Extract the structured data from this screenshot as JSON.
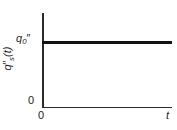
{
  "chart_data": {
    "type": "line",
    "title": "",
    "xlabel": "t",
    "ylabel": "q″ₛ(t)",
    "ylabel_base": "q",
    "ylabel_prime": "″",
    "ylabel_sub": "s",
    "ylabel_arg": "(t)",
    "x": [
      0,
      1
    ],
    "series": [
      {
        "name": "q″ₛ(t)",
        "values": [
          1,
          1
        ],
        "description": "constant heat flux at value q₀″"
      }
    ],
    "xlim": [
      0,
      1
    ],
    "ylim": [
      0,
      1.37
    ],
    "grid": false,
    "legend": false,
    "x_tick_labels": [
      "0"
    ],
    "y_tick_labels": [
      "0",
      "q₀″"
    ],
    "y_tick_values": [
      0,
      1
    ],
    "annotations": []
  },
  "labels": {
    "y_tick_zero": "0",
    "x_tick_zero": "0",
    "x_axis_symbol": "t",
    "y_value_base": "q",
    "y_value_sub": "0",
    "y_value_prime": "″",
    "y_axis_base": "q",
    "y_axis_prime": "″",
    "y_axis_sub": "s",
    "y_axis_arg": "(t)"
  },
  "colors": {
    "axis": "#2b2b2b",
    "line": "#111111",
    "text": "#1c1c1c",
    "background": "#ffffff"
  }
}
